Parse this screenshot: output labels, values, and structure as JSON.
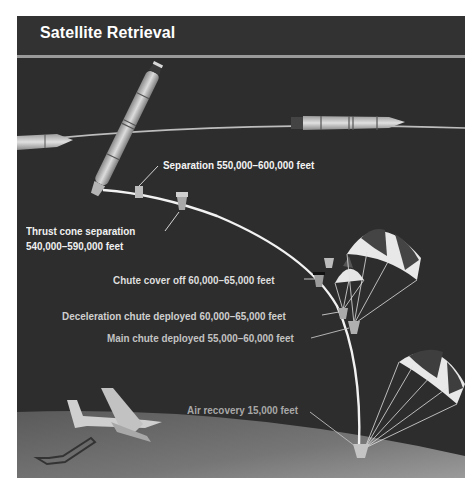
{
  "title": "Satellite Retrieval",
  "colors": {
    "background": "#2d2d2d",
    "title_bar": "#323232",
    "rule": "#9a9a9a",
    "trajectory": "#f2f2f2",
    "earth": "#6e6e6e"
  },
  "stages": [
    {
      "id": "separation",
      "label": "Separation 550,000–600,000 feet",
      "color": "#f4f4f4"
    },
    {
      "id": "thrust-cone-separation",
      "label_line1": "Thrust cone separation",
      "label_line2": "540,000–590,000 feet",
      "color": "#f0f0f0"
    },
    {
      "id": "chute-cover-off",
      "label": "Chute cover off 60,000–65,000 feet",
      "color": "#dedede"
    },
    {
      "id": "deceleration-chute-deployed",
      "label": "Deceleration chute deployed 60,000–65,000 feet",
      "color": "#cfcfcf"
    },
    {
      "id": "main-chute-deployed",
      "label": "Main chute deployed 55,000–60,000 feet",
      "color": "#c2c2c2"
    },
    {
      "id": "air-recovery",
      "label": "Air recovery 15,000 feet",
      "color": "#a8a8a8"
    }
  ],
  "illustrations": [
    "rocket-upper",
    "rocket-left",
    "rocket-right",
    "orbit-line",
    "trajectory",
    "capsule",
    "thrust-cone",
    "drogue-chute",
    "main-chute",
    "recovery-chute",
    "aircraft",
    "earth"
  ]
}
